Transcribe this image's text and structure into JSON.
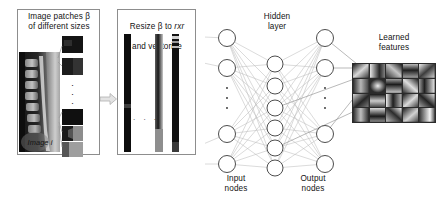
{
  "figure": {
    "kind": "pipeline-diagram",
    "title_absent": true
  },
  "labels": {
    "patches": "Image patches β\nof different sizes",
    "resize_line1": "Resize β to ",
    "resize_rxr": "rxr",
    "resize_line2": "and vectorize",
    "image_i": "Image i",
    "hidden_layer": "Hidden\nlayer",
    "input_nodes": "Input\nnodes",
    "output_nodes": "Output\nnodes",
    "learned_features": "Learned\nfeatures",
    "vertical_dots": ". . .",
    "patch_dots": "·"
  },
  "network": {
    "input_nodes_visible": 4,
    "hidden_nodes_visible": 6,
    "output_nodes_visible": 4,
    "ellipsis_input": "⋮",
    "ellipsis_output": "⋮",
    "node_stroke": "#4d4d4d",
    "edge_color": "#b5b5b5"
  },
  "learned_features_grid": {
    "columns": 5,
    "rows": 4,
    "cell_count": 20
  },
  "colors": {
    "panel_border": "#8d8d8d",
    "arrow": "#c9c9c9",
    "text": "#131313",
    "background": "#ffffff"
  },
  "patches": {
    "count_visible": 5,
    "note_dots": "·"
  },
  "vectors": {
    "strips_visible": 3
  }
}
